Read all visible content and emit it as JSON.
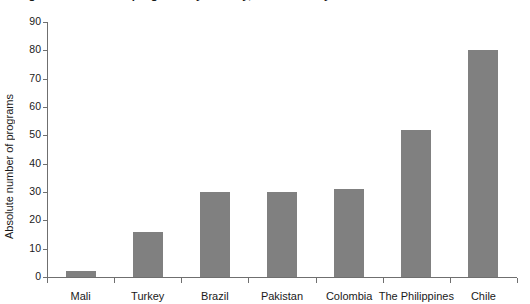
{
  "figure": {
    "title_clipped": "Figure 3. Number of programs by country, most recent year available",
    "y_axis_title": "Absolute number of programs"
  },
  "chart_data": {
    "type": "bar",
    "title": "",
    "xlabel": "",
    "ylabel": "Absolute number of programs",
    "categories": [
      "Mali",
      "Turkey",
      "Brazil",
      "Pakistan",
      "Colombia",
      "The Philippines",
      "Chile"
    ],
    "values": [
      2,
      16,
      30,
      30,
      31,
      52,
      80
    ],
    "series": [
      {
        "name": "Absolute number of programs",
        "values": [
          2,
          16,
          30,
          30,
          31,
          52,
          80
        ],
        "color": "#808080"
      }
    ],
    "ylim": [
      0,
      90
    ],
    "ytick_labels": [
      "0",
      "10",
      "20",
      "30",
      "40",
      "50",
      "60",
      "70",
      "80",
      "90"
    ],
    "ytick_values": [
      0,
      10,
      20,
      30,
      40,
      50,
      60,
      70,
      80,
      90
    ],
    "grid": false,
    "legend": false,
    "legend_position": "none",
    "bar_color": "#808080",
    "axis_color": "#6f6f6f",
    "background": "#ffffff"
  }
}
